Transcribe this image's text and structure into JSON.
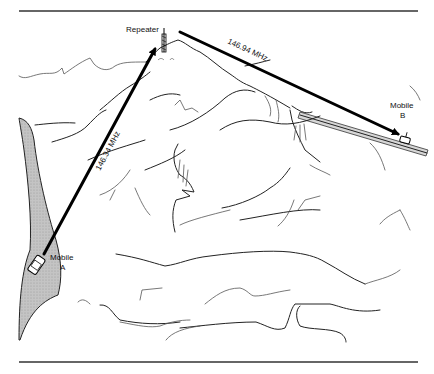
{
  "figure": {
    "nodes": {
      "repeater": {
        "label": "Repeater"
      },
      "mobile_a": {
        "label_line1": "Mobile",
        "label_line2": "A"
      },
      "mobile_b": {
        "label_line1": "Mobile",
        "label_line2": "B"
      }
    },
    "links": [
      {
        "from": "Mobile A",
        "to": "Repeater",
        "frequency": "146.34 MHz"
      },
      {
        "from": "Repeater",
        "to": "Mobile B",
        "frequency": "146.94 MHz"
      }
    ],
    "colors": {
      "line": "#000000",
      "road_fill": "#bdbdbd",
      "rule": "#333333",
      "background": "#ffffff"
    }
  }
}
